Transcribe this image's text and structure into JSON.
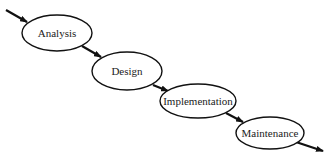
{
  "diagram": {
    "type": "waterfall-process",
    "colors": {
      "stroke": "#111111",
      "text": "#222222",
      "background": "#ffffff"
    },
    "nodes": [
      {
        "id": "analysis",
        "label": "Analysis",
        "cx": 57,
        "cy": 33,
        "rx": 35,
        "ry": 18
      },
      {
        "id": "design",
        "label": "Design",
        "cx": 127,
        "cy": 71,
        "rx": 35,
        "ry": 19
      },
      {
        "id": "implementation",
        "label": "Implementation",
        "cx": 198,
        "cy": 101,
        "rx": 38,
        "ry": 17
      },
      {
        "id": "maintenance",
        "label": "Maintenance",
        "cx": 270,
        "cy": 133,
        "rx": 34,
        "ry": 16
      }
    ],
    "edges": [
      {
        "from": "start",
        "to": "analysis"
      },
      {
        "from": "analysis",
        "to": "design"
      },
      {
        "from": "design",
        "to": "implementation"
      },
      {
        "from": "implementation",
        "to": "maintenance"
      },
      {
        "from": "maintenance",
        "to": "end"
      }
    ]
  }
}
